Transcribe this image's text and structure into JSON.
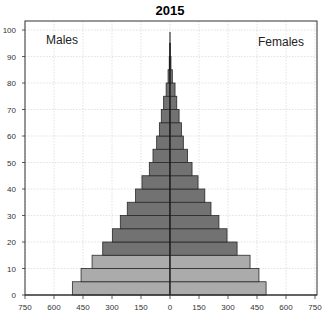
{
  "chart_data": {
    "type": "bar",
    "subtype": "population-pyramid",
    "title": "2015",
    "xlabel": "",
    "ylabel": "",
    "left_label": "Males",
    "right_label": "Females",
    "x_ticks": [
      "750",
      "600",
      "450",
      "300",
      "150",
      "0",
      "150",
      "300",
      "450",
      "600",
      "750"
    ],
    "x_tick_values": [
      -750,
      -600,
      -450,
      -300,
      -150,
      0,
      150,
      300,
      450,
      600,
      750
    ],
    "y_ticks": [
      "0",
      "10",
      "20",
      "30",
      "40",
      "50",
      "60",
      "70",
      "80",
      "90",
      "100"
    ],
    "xlim": [
      -750,
      750
    ],
    "ylim": [
      0,
      100
    ],
    "grid": true,
    "categories": [
      "0-4",
      "5-9",
      "10-14",
      "15-19",
      "20-24",
      "25-29",
      "30-34",
      "35-39",
      "40-44",
      "45-49",
      "50-54",
      "55-59",
      "60-64",
      "65-69",
      "70-74",
      "75-79",
      "80-84",
      "85-89",
      "90-94",
      "95-99"
    ],
    "series": [
      {
        "name": "Males",
        "values": [
          505,
          460,
          403,
          348,
          298,
          257,
          221,
          178,
          145,
          107,
          88,
          69,
          55,
          45,
          33,
          20,
          10,
          4,
          1,
          0
        ]
      },
      {
        "name": "Females",
        "values": [
          497,
          460,
          414,
          347,
          295,
          253,
          212,
          180,
          145,
          114,
          91,
          69,
          59,
          47,
          35,
          26,
          12,
          5,
          1,
          0
        ]
      }
    ],
    "colors": {
      "young": "#ababab",
      "adult": "#727272",
      "border": "#2a2a2a",
      "grid": "#cfcfcf"
    },
    "young_band_count": 3
  }
}
